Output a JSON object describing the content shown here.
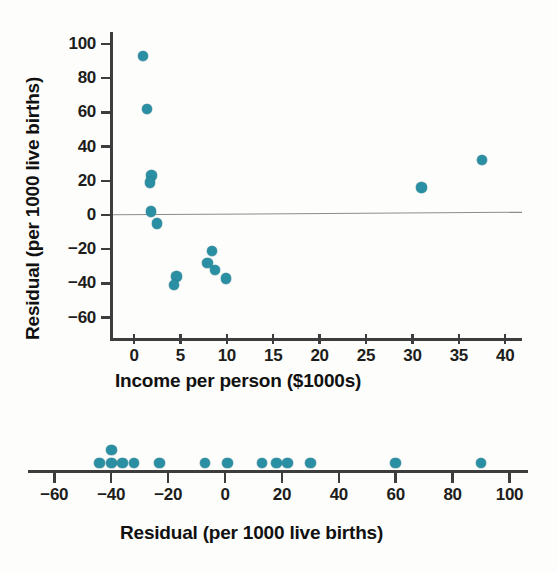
{
  "chart_data": [
    {
      "type": "scatter",
      "name": "residual-vs-income-scatterplot",
      "title": "",
      "xlabel": "Income per person ($1000s)",
      "ylabel": "Residual (per 1000 live births)",
      "xlim": [
        -3,
        41.5
      ],
      "ylim": [
        -68,
        105
      ],
      "xticks": [
        0,
        5,
        10,
        15,
        20,
        25,
        30,
        35,
        40
      ],
      "xtick_labels": [
        "0",
        "5",
        "10",
        "15",
        "20",
        "25",
        "30",
        "35",
        "40"
      ],
      "yticks": [
        100,
        80,
        60,
        40,
        20,
        0,
        -20,
        -40,
        -60
      ],
      "ytick_labels": [
        "100",
        "80",
        "60",
        "40",
        "20",
        "0",
        "-20",
        "-40",
        "-60"
      ],
      "grid": false,
      "legend": "none",
      "reference_line": {
        "label": "zero-residual-line",
        "y": 0,
        "color": "#8d8d8d"
      },
      "marker_color": "#2b8fa3",
      "points": [
        {
          "x": 1.0,
          "y": 93
        },
        {
          "x": 1.4,
          "y": 62
        },
        {
          "x": 1.9,
          "y": 23
        },
        {
          "x": 1.7,
          "y": 19
        },
        {
          "x": 1.8,
          "y": 2
        },
        {
          "x": 2.5,
          "y": -5
        },
        {
          "x": 4.6,
          "y": -36
        },
        {
          "x": 4.3,
          "y": -41
        },
        {
          "x": 8.4,
          "y": -21
        },
        {
          "x": 7.9,
          "y": -28
        },
        {
          "x": 8.7,
          "y": -32
        },
        {
          "x": 9.9,
          "y": -37
        },
        {
          "x": 31.0,
          "y": 16
        },
        {
          "x": 37.5,
          "y": 32
        }
      ]
    },
    {
      "type": "dotplot",
      "name": "residual-dotplot",
      "title": "",
      "xlabel": "Residual (per 1000 live births)",
      "xlim": [
        -70,
        103
      ],
      "xticks": [
        -60,
        -40,
        -20,
        0,
        20,
        40,
        60,
        80,
        100
      ],
      "xtick_labels": [
        "-60",
        "-40",
        "-20",
        "0",
        "20",
        "40",
        "60",
        "80",
        "100"
      ],
      "grid": false,
      "legend": "none",
      "marker_color": "#2b8fa3",
      "values": [
        -44,
        -41,
        -40,
        -36,
        -32,
        -23,
        -7,
        1,
        13,
        18,
        22,
        30,
        60,
        90
      ],
      "stacks": [
        {
          "value": -44,
          "count": 1
        },
        {
          "value": -40,
          "count": 2
        },
        {
          "value": -36,
          "count": 1
        },
        {
          "value": -32,
          "count": 1
        },
        {
          "value": -23,
          "count": 1
        },
        {
          "value": -7,
          "count": 1
        },
        {
          "value": 1,
          "count": 1
        },
        {
          "value": 13,
          "count": 1
        },
        {
          "value": 18,
          "count": 1
        },
        {
          "value": 22,
          "count": 1
        },
        {
          "value": 30,
          "count": 1
        },
        {
          "value": 60,
          "count": 1
        },
        {
          "value": 90,
          "count": 1
        }
      ]
    }
  ],
  "scatter": {
    "ylabel": "Residual (per 1000 live births)",
    "xlabel": "Income per person ($1000s)"
  },
  "dotplot": {
    "xlabel": "Residual (per 1000 live births)"
  }
}
